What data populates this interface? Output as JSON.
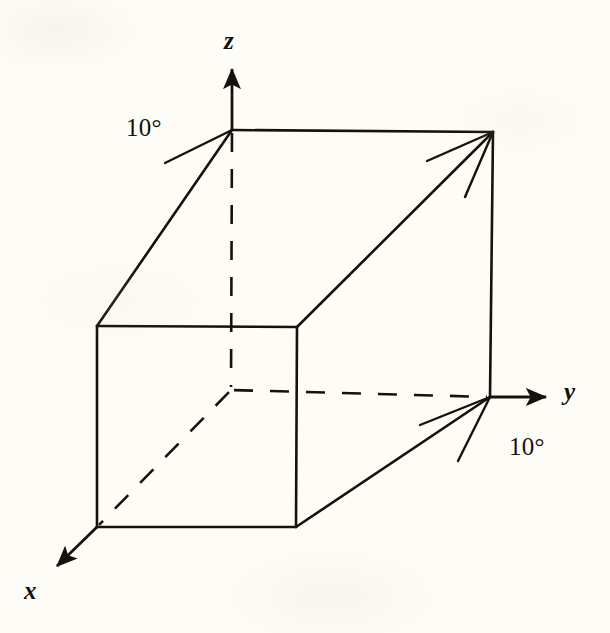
{
  "figure": {
    "background_color": "#fdfcf6",
    "ink_color": "#15120c",
    "axis_labels": {
      "z": "z",
      "y": "y",
      "x": "x"
    },
    "annotations": {
      "angle_top_left": "10°",
      "angle_bottom_right": "10°"
    }
  },
  "chart_data": {
    "type": "diagram",
    "xlabel": "x",
    "ylabel": "y",
    "zlabel": "z",
    "annotations": [
      {
        "text": "10°",
        "x": 145,
        "y": 128,
        "near": "z-axis-vertex"
      },
      {
        "text": "10°",
        "x": 528,
        "y": 447,
        "near": "y-axis-vertex"
      }
    ],
    "axes": [
      {
        "name": "z",
        "from": [
          232,
          130
        ],
        "to": [
          232,
          62
        ],
        "arrow": true,
        "label": "z",
        "label_pos": [
          232,
          40
        ]
      },
      {
        "name": "y",
        "from": [
          490,
          397
        ],
        "to": [
          553,
          397
        ],
        "arrow": true,
        "label": "y",
        "label_pos": [
          572,
          392
        ]
      },
      {
        "name": "x",
        "from": [
          97,
          527
        ],
        "to": [
          52,
          571
        ],
        "arrow": true,
        "label": "x",
        "label_pos": [
          33,
          590
        ]
      }
    ],
    "vertices": {
      "z_top": [
        232,
        130
      ],
      "top_far_right": [
        493,
        132
      ],
      "front_top_left": [
        97,
        326
      ],
      "front_top_right": [
        297,
        327
      ],
      "front_bottom_left": [
        97,
        527
      ],
      "front_bottom_right": [
        296,
        527
      ],
      "y_right": [
        490,
        397
      ],
      "interior_origin": [
        231,
        390
      ]
    },
    "solid_edges": [
      {
        "from": [
          232,
          130
        ],
        "to": [
          493,
          132
        ],
        "desc": "top-back edge"
      },
      {
        "from": [
          232,
          130
        ],
        "to": [
          97,
          326
        ],
        "desc": "upper-left slanted edge"
      },
      {
        "from": [
          493,
          132
        ],
        "to": [
          297,
          327
        ],
        "desc": "upper-right slanted edge"
      },
      {
        "from": [
          493,
          132
        ],
        "to": [
          490,
          397
        ],
        "desc": "far right vertical edge"
      },
      {
        "from": [
          97,
          326
        ],
        "to": [
          297,
          327
        ],
        "desc": "front face top"
      },
      {
        "from": [
          297,
          327
        ],
        "to": [
          296,
          527
        ],
        "desc": "front face right"
      },
      {
        "from": [
          296,
          527
        ],
        "to": [
          97,
          527
        ],
        "desc": "front face bottom"
      },
      {
        "from": [
          97,
          527
        ],
        "to": [
          97,
          326
        ],
        "desc": "front face left"
      },
      {
        "from": [
          296,
          527
        ],
        "to": [
          490,
          397
        ],
        "desc": "lower-right slanted edge"
      }
    ],
    "dashed_edges": [
      {
        "from": [
          232,
          130
        ],
        "to": [
          231,
          390
        ],
        "desc": "hidden vertical edge"
      },
      {
        "from": [
          231,
          390
        ],
        "to": [
          490,
          397
        ],
        "desc": "hidden depth edge to y axis"
      },
      {
        "from": [
          231,
          390
        ],
        "to": [
          97,
          527
        ],
        "desc": "hidden diagonal to front-bottom-left"
      }
    ],
    "angle_tick_rays": [
      {
        "from": [
          232,
          130
        ],
        "to": [
          165,
          163
        ],
        "desc": "upper 10 degree guide ray"
      },
      {
        "from": [
          493,
          132
        ],
        "to": [
          427,
          161
        ],
        "desc": "upper-right guide ray shallow"
      },
      {
        "from": [
          493,
          132
        ],
        "to": [
          465,
          197
        ],
        "desc": "upper-right guide ray steep"
      },
      {
        "from": [
          490,
          397
        ],
        "to": [
          420,
          425
        ],
        "desc": "lower-right guide ray shallow"
      },
      {
        "from": [
          490,
          397
        ],
        "to": [
          458,
          461
        ],
        "desc": "lower-right guide ray steep"
      }
    ],
    "grid": false,
    "legend": null
  }
}
